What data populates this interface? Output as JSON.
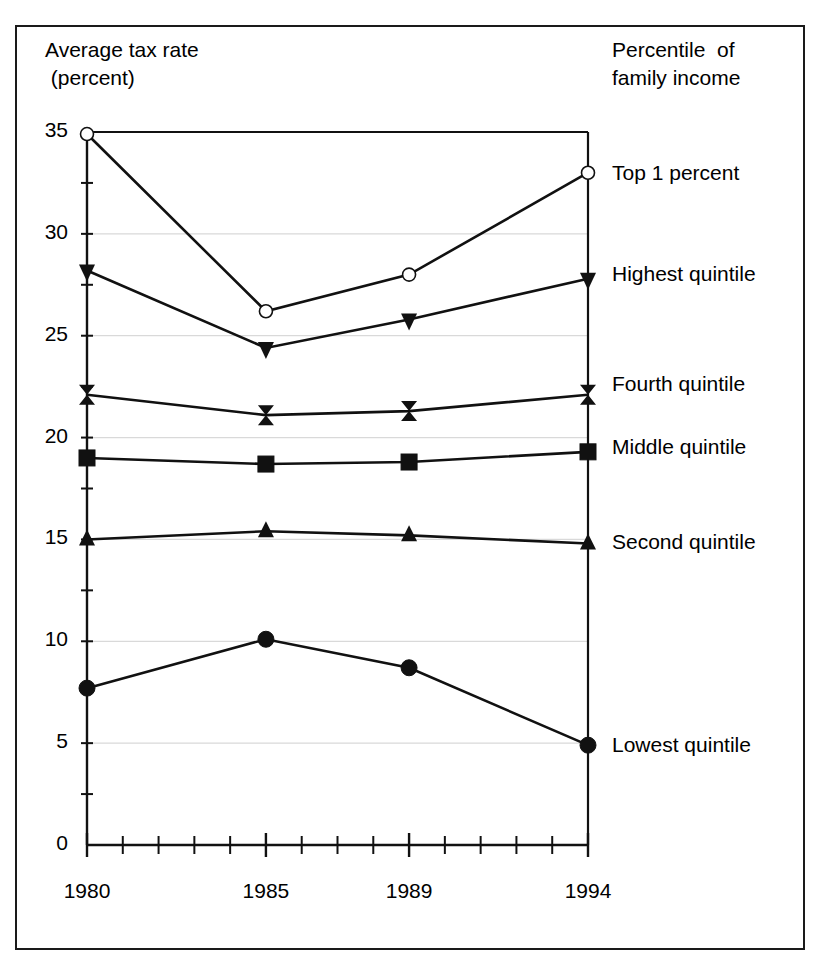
{
  "figure": {
    "y_axis_title": "Average tax rate\n (percent)",
    "legend_title": "Percentile  of\nfamily income"
  },
  "chart_data": {
    "type": "line",
    "title": "",
    "xlabel": "",
    "ylabel": "Average tax rate (percent)",
    "ylim": [
      0,
      35
    ],
    "xlim": [
      1980,
      1994
    ],
    "grid": true,
    "legend_position": "right",
    "categories": [
      "1980",
      "1985",
      "1989",
      "1994"
    ],
    "x": [
      1980,
      1985,
      1989,
      1994
    ],
    "y_ticks": [
      0,
      5,
      10,
      15,
      20,
      25,
      30,
      35
    ],
    "y_tick_labels": [
      "0",
      "5",
      "10",
      "15",
      "20",
      "25",
      "30",
      "35"
    ],
    "x_ticks": [
      1980,
      1981,
      1982,
      1983,
      1984,
      1985,
      1986,
      1987,
      1988,
      1989,
      1990,
      1991,
      1992,
      1993,
      1994
    ],
    "x_tick_labels": [
      "1980",
      "1985",
      "1989",
      "1994"
    ],
    "x_labeled_ticks": [
      1980,
      1985,
      1989,
      1994
    ],
    "series": [
      {
        "name": "Top 1 percent",
        "marker": "open-circle",
        "values": [
          34.9,
          26.2,
          28.0,
          33.0
        ]
      },
      {
        "name": "Highest quintile",
        "marker": "filled-down-triangle",
        "values": [
          28.2,
          24.4,
          25.8,
          27.8
        ]
      },
      {
        "name": "Fourth quintile",
        "marker": "filled-bowtie",
        "values": [
          22.1,
          21.1,
          21.3,
          22.1
        ]
      },
      {
        "name": "Middle quintile",
        "marker": "filled-square",
        "values": [
          19.0,
          18.7,
          18.8,
          19.3
        ]
      },
      {
        "name": "Second quintile",
        "marker": "filled-up-triangle",
        "values": [
          15.0,
          15.4,
          15.2,
          14.8
        ]
      },
      {
        "name": "Lowest quintile",
        "marker": "filled-circle",
        "values": [
          7.7,
          10.1,
          8.7,
          4.9
        ]
      }
    ],
    "colors": {
      "line": "#111111",
      "grid": "#d9d9d9",
      "axis": "#111111",
      "background": "#ffffff"
    }
  },
  "legend_labels": [
    {
      "label": "Top 1 percent",
      "y": 174
    },
    {
      "label": "Highest quintile",
      "y": 275
    },
    {
      "label": "Fourth quintile",
      "y": 385
    },
    {
      "label": "Middle quintile",
      "y": 448
    },
    {
      "label": "Second quintile",
      "y": 543
    },
    {
      "label": "Lowest quintile",
      "y": 746
    }
  ]
}
